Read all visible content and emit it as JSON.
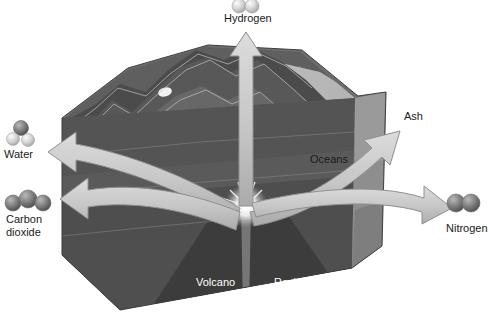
{
  "diagram": {
    "colors": {
      "background": "#ffffff",
      "arrow_fill": "#c9c9c9",
      "arrow_stroke": "#8f8f8f",
      "mountain_dark": "#4a4a4a",
      "mountain_mid": "#636363",
      "mountain_light": "#8a8a8a",
      "ocean": "#b5b5b5",
      "crust_face": "#565656",
      "magma_dark": "#3a3a3a",
      "label_text": "#1a1a1a",
      "label_text_inner": "#ffffff",
      "molecule_dark": "#707070",
      "molecule_light": "#c4c4c4"
    },
    "outputs": [
      {
        "id": "hydrogen",
        "label": "Hydrogen",
        "molecule": "two-sphere-light",
        "atoms": 2,
        "direction": "up"
      },
      {
        "id": "ash",
        "label": "Ash",
        "molecule": "none",
        "atoms": 0,
        "direction": "upper-right"
      },
      {
        "id": "nitrogen",
        "label": "Nitrogen",
        "molecule": "two-sphere-dark",
        "atoms": 2,
        "direction": "lower-right"
      },
      {
        "id": "water",
        "label": "Water",
        "molecule": "three-sphere-water",
        "atoms": 3,
        "direction": "upper-left"
      },
      {
        "id": "carbon-dioxide",
        "label": "Carbon\ndioxide",
        "molecule": "three-sphere-dark",
        "atoms": 3,
        "direction": "left"
      }
    ],
    "scene_labels": [
      {
        "id": "oceans",
        "text": "Oceans",
        "style": "dark"
      },
      {
        "id": "volcano",
        "text": "Volcano",
        "style": "white"
      },
      {
        "id": "rocks-lava-ash",
        "text": "Rocks, lava,\nash",
        "style": "white"
      }
    ]
  }
}
